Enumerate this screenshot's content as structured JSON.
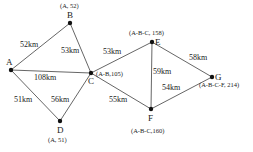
{
  "diagram": {
    "type": "weighted-graph-shortest-path",
    "colors": {
      "edge": "#555555",
      "node": "#111111",
      "text": "#222222",
      "background": "#ffffff"
    },
    "nodes": [
      {
        "id": "A",
        "label": "A",
        "x": 11,
        "y": 70,
        "annotation": ""
      },
      {
        "id": "B",
        "label": "B",
        "x": 70,
        "y": 23,
        "annotation": "(A, 52)"
      },
      {
        "id": "C",
        "label": "C",
        "x": 91,
        "y": 73,
        "annotation": "(A-B,105)"
      },
      {
        "id": "D",
        "label": "D",
        "x": 60,
        "y": 121,
        "annotation": "(A, 51)"
      },
      {
        "id": "E",
        "label": "E",
        "x": 152,
        "y": 42,
        "annotation": "(A-B-C, 158)"
      },
      {
        "id": "F",
        "label": "F",
        "x": 151,
        "y": 109,
        "annotation": "(A-B-C,160)"
      },
      {
        "id": "G",
        "label": "G",
        "x": 212,
        "y": 77,
        "annotation": "(A-B-C-F, 214)"
      }
    ],
    "edges": [
      {
        "from": "A",
        "to": "B",
        "label": "52km"
      },
      {
        "from": "B",
        "to": "C",
        "label": "53km"
      },
      {
        "from": "A",
        "to": "C",
        "label": "108km"
      },
      {
        "from": "A",
        "to": "D",
        "label": "51km"
      },
      {
        "from": "D",
        "to": "C",
        "label": "56km"
      },
      {
        "from": "C",
        "to": "E",
        "label": "53km"
      },
      {
        "from": "C",
        "to": "F",
        "label": "55km"
      },
      {
        "from": "E",
        "to": "F",
        "label": "59km"
      },
      {
        "from": "E",
        "to": "G",
        "label": "58km"
      },
      {
        "from": "F",
        "to": "G",
        "label": "54km"
      }
    ]
  }
}
